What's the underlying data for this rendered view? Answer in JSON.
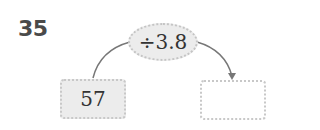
{
  "problem": {
    "number": "35"
  },
  "operation": {
    "label": "÷3.8"
  },
  "input_box": {
    "value": "57"
  },
  "output_box": {
    "value": ""
  },
  "colors": {
    "box_fill": "#ececec",
    "border": "#c4c4c4",
    "arrow": "#777777",
    "number": "#4a4a4a"
  }
}
